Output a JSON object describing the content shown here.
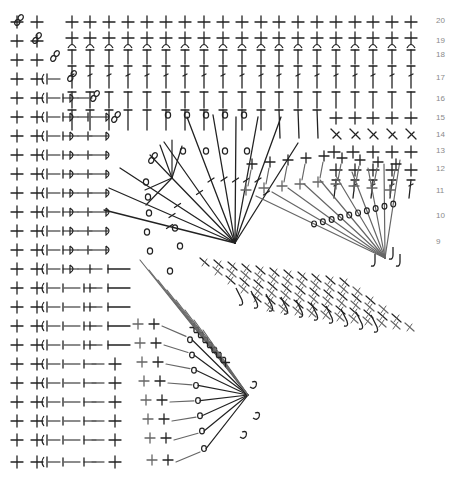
{
  "diagram": {
    "type": "crochet-chart",
    "ink_color": "#222222",
    "grey_color": "#666666",
    "label_color": "#8a8a8a",
    "row_labels": [
      {
        "row": "20",
        "y": 23
      },
      {
        "row": "19",
        "y": 43
      },
      {
        "row": "18",
        "y": 57
      },
      {
        "row": "17",
        "y": 80
      },
      {
        "row": "16",
        "y": 101
      },
      {
        "row": "15",
        "y": 120
      },
      {
        "row": "14",
        "y": 137
      },
      {
        "row": "13",
        "y": 153
      },
      {
        "row": "12",
        "y": 171
      },
      {
        "row": "11",
        "y": 193
      },
      {
        "row": "10",
        "y": 218
      },
      {
        "row": "9",
        "y": 244
      }
    ],
    "label_x": 436,
    "top_columns_x": [
      72,
      90,
      109,
      128,
      147,
      166,
      185,
      204,
      223,
      242,
      261,
      279,
      298,
      317,
      336,
      355,
      373,
      392,
      411
    ],
    "left_rows_y": [
      22,
      41,
      60,
      79,
      98,
      117,
      136,
      155,
      174,
      193,
      212,
      231,
      250,
      269,
      288,
      307,
      326,
      345,
      364,
      383,
      402,
      421,
      440,
      462
    ],
    "focal_points": [
      {
        "name": "center-upper",
        "x": 235,
        "y": 243
      },
      {
        "name": "center-right",
        "x": 385,
        "y": 258
      },
      {
        "name": "center-lower",
        "x": 248,
        "y": 395
      },
      {
        "name": "center-top",
        "x": 172,
        "y": 178
      }
    ],
    "legend": {
      "symbols": [
        "sc-cross",
        "hdc-t",
        "dc-t-bar",
        "ch-ring",
        "slst-hook"
      ]
    }
  }
}
